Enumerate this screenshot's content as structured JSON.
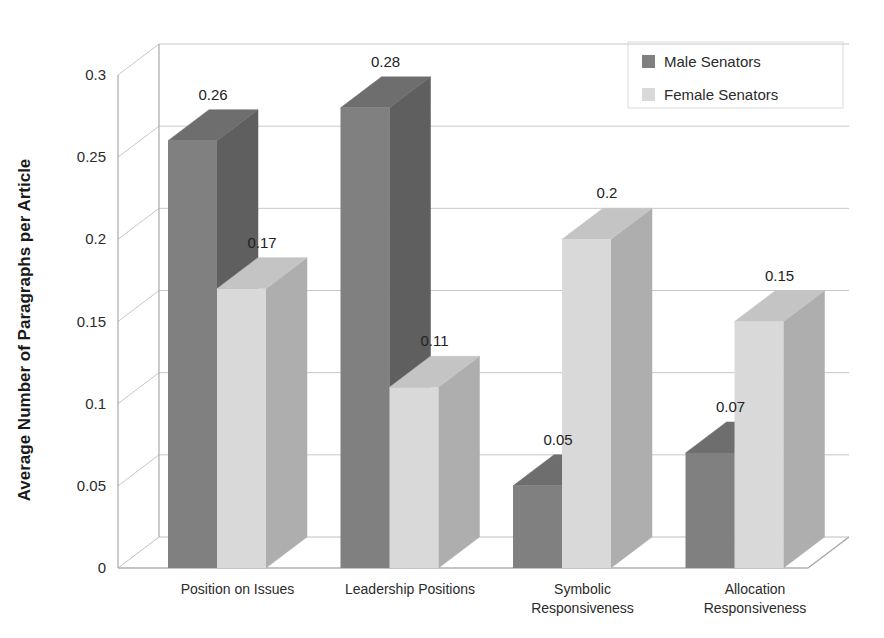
{
  "chart_data": {
    "type": "bar",
    "title": "",
    "subtitle": "",
    "xlabel": "",
    "ylabel": "Average Number of Paragraphs per Article",
    "ylim": [
      0,
      0.3
    ],
    "ytick_labels": [
      "0",
      "0.05",
      "0.1",
      "0.15",
      "0.2",
      "0.25",
      "0.3"
    ],
    "ytick_values": [
      0,
      0.05,
      0.1,
      0.15,
      0.2,
      0.25,
      0.3
    ],
    "grid": true,
    "legend_position": "top-right",
    "three_d": true,
    "categories": [
      "Position on Issues",
      "Leadership Positions",
      "Symbolic Responsiveness",
      "Allocation Responsiveness"
    ],
    "category_lines": [
      [
        "Position on Issues"
      ],
      [
        "Leadership Positions"
      ],
      [
        "Symbolic",
        "Responsiveness"
      ],
      [
        "Allocation",
        "Responsiveness"
      ]
    ],
    "series": [
      {
        "name": "Male Senators",
        "color": "#808080",
        "top_color": "#6e6e6e",
        "side_color": "#5f5f5f",
        "values": [
          0.26,
          0.28,
          0.05,
          0.07
        ],
        "labels": [
          "0.26",
          "0.28",
          "0.05",
          "0.07"
        ]
      },
      {
        "name": "Female Senators",
        "color": "#d9d9d9",
        "top_color": "#c4c4c4",
        "side_color": "#aeaeae",
        "values": [
          0.17,
          0.11,
          0.2,
          0.15
        ],
        "labels": [
          "0.17",
          "0.11",
          "0.2",
          "0.15"
        ]
      }
    ]
  },
  "legend": {
    "items": [
      {
        "label": "Male Senators",
        "color": "#808080"
      },
      {
        "label": "Female Senators",
        "color": "#d9d9d9"
      }
    ]
  },
  "axes": {
    "y_axis_title": "Average Number of Paragraphs per Article"
  }
}
